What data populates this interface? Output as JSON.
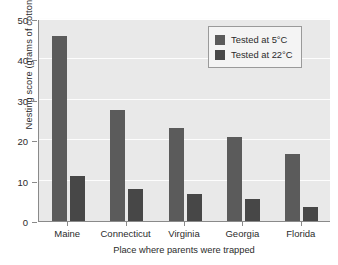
{
  "chart_data": {
    "type": "bar",
    "title": "",
    "subtitle": "",
    "xlabel": "Place where parents were trapped",
    "ylabel": "Nesting score (grams of cotton)",
    "categories": [
      "Maine",
      "Connecticut",
      "Virginia",
      "Georgia",
      "Florida"
    ],
    "series": [
      {
        "name": "Tested at 5°C",
        "color": "#5b5b5b",
        "values": [
          45.8,
          27.5,
          23.1,
          20.8,
          16.6
        ]
      },
      {
        "name": "Tested at 22°C",
        "color": "#474747",
        "values": [
          11.2,
          7.9,
          6.8,
          5.4,
          3.4
        ]
      }
    ],
    "ylim": [
      0,
      50
    ],
    "ytick_labels": [
      "0",
      "10",
      "20",
      "30",
      "40",
      "50"
    ],
    "ytick_values": [
      0,
      10,
      20,
      30,
      40,
      50
    ],
    "grid": "horizontal",
    "legend_position": "top-right-inside",
    "plot_background": "#e9e9e9",
    "gridline_color": "#fdfdfd",
    "axis_color": "#8a8a8a"
  }
}
